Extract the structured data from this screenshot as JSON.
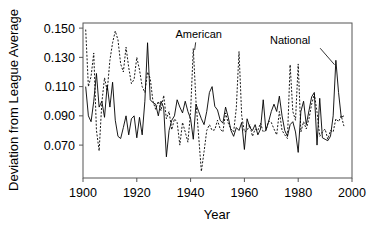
{
  "chart_data": {
    "type": "line",
    "title": "",
    "xlabel": "Year",
    "ylabel": "Deviation from League Average",
    "xlim": [
      1900,
      2000
    ],
    "ylim": [
      0.0475,
      0.1535
    ],
    "xticks": [
      1900,
      1920,
      1940,
      1960,
      1980,
      2000
    ],
    "xtick_labels": [
      "1900",
      "1920",
      "1940",
      "1960",
      "1980",
      "2000"
    ],
    "yticks": [
      0.07,
      0.09,
      0.11,
      0.13,
      0.15
    ],
    "ytick_labels": [
      "0.070",
      "0.090",
      "0.110",
      "0.130",
      "0.150"
    ],
    "grid": false,
    "legend_position": "inline-annotations",
    "frame_color": "#555555",
    "series": [
      {
        "name": "American",
        "style": "dashed",
        "color": "#000000",
        "annotation": {
          "label": "American",
          "text_x": 1943,
          "text_y": 0.143,
          "point_x": 1941.5,
          "point_y": 0.135
        },
        "x": [
          1901,
          1902,
          1903,
          1904,
          1905,
          1906,
          1907,
          1908,
          1909,
          1910,
          1911,
          1912,
          1913,
          1914,
          1915,
          1916,
          1917,
          1918,
          1919,
          1920,
          1921,
          1922,
          1923,
          1924,
          1925,
          1926,
          1927,
          1928,
          1929,
          1930,
          1931,
          1932,
          1933,
          1934,
          1935,
          1936,
          1937,
          1938,
          1939,
          1940,
          1941,
          1942,
          1943,
          1944,
          1945,
          1946,
          1947,
          1948,
          1949,
          1950,
          1951,
          1952,
          1953,
          1954,
          1955,
          1956,
          1957,
          1958,
          1959,
          1960,
          1961,
          1962,
          1963,
          1964,
          1965,
          1966,
          1967,
          1968,
          1969,
          1970,
          1971,
          1972,
          1973,
          1974,
          1975,
          1976,
          1977,
          1978,
          1979,
          1980,
          1981,
          1982,
          1983,
          1984,
          1985,
          1986,
          1987,
          1988,
          1989,
          1990,
          1991,
          1992,
          1993,
          1994,
          1995,
          1996,
          1997
        ],
        "values": [
          0.149,
          0.11,
          0.117,
          0.133,
          0.08,
          0.066,
          0.099,
          0.116,
          0.107,
          0.128,
          0.14,
          0.148,
          0.142,
          0.1255,
          0.12,
          0.137,
          0.123,
          0.112,
          0.115,
          0.13,
          0.1215,
          0.11,
          0.106,
          0.12,
          0.1155,
          0.1,
          0.0945,
          0.1,
          0.0935,
          0.104,
          0.088,
          0.093,
          0.0805,
          0.088,
          0.0855,
          0.07,
          0.0855,
          0.079,
          0.072,
          0.093,
          0.136,
          0.1,
          0.076,
          0.052,
          0.0655,
          0.08,
          0.084,
          0.08,
          0.0805,
          0.087,
          0.081,
          0.079,
          0.092,
          0.085,
          0.081,
          0.079,
          0.0955,
          0.134,
          0.09,
          0.079,
          0.08,
          0.084,
          0.076,
          0.081,
          0.08,
          0.085,
          0.079,
          0.08,
          0.0865,
          0.0855,
          0.081,
          0.077,
          0.093,
          0.08,
          0.077,
          0.0745,
          0.125,
          0.093,
          0.087,
          0.1255,
          0.079,
          0.086,
          0.081,
          0.088,
          0.098,
          0.105,
          0.0925,
          0.076,
          0.079,
          0.081,
          0.074,
          0.08,
          0.079,
          0.088,
          0.086,
          0.09,
          0.083
        ]
      },
      {
        "name": "National",
        "style": "solid",
        "color": "#000000",
        "annotation": {
          "label": "National",
          "text_x": 1977,
          "text_y": 0.139,
          "point_x": 1993.5,
          "point_y": 0.125
        },
        "x": [
          1901,
          1902,
          1903,
          1904,
          1905,
          1906,
          1907,
          1908,
          1909,
          1910,
          1911,
          1912,
          1913,
          1914,
          1915,
          1916,
          1917,
          1918,
          1919,
          1920,
          1921,
          1922,
          1923,
          1924,
          1925,
          1926,
          1927,
          1928,
          1929,
          1930,
          1931,
          1932,
          1933,
          1934,
          1935,
          1936,
          1937,
          1938,
          1939,
          1940,
          1941,
          1942,
          1943,
          1944,
          1945,
          1946,
          1947,
          1948,
          1949,
          1950,
          1951,
          1952,
          1953,
          1954,
          1955,
          1956,
          1957,
          1958,
          1959,
          1960,
          1961,
          1962,
          1963,
          1964,
          1965,
          1966,
          1967,
          1968,
          1969,
          1970,
          1971,
          1972,
          1973,
          1974,
          1975,
          1976,
          1977,
          1978,
          1979,
          1980,
          1981,
          1982,
          1983,
          1984,
          1985,
          1986,
          1987,
          1988,
          1989,
          1990,
          1991,
          1992,
          1993,
          1994,
          1995,
          1996,
          1997
        ],
        "values": [
          0.11,
          0.09,
          0.086,
          0.1,
          0.119,
          0.096,
          0.1,
          0.089,
          0.111,
          0.096,
          0.113,
          0.087,
          0.076,
          0.0745,
          0.082,
          0.09,
          0.077,
          0.088,
          0.09,
          0.075,
          0.089,
          0.077,
          0.1,
          0.14,
          0.101,
          0.099,
          0.098,
          0.09,
          0.1,
          0.0955,
          0.062,
          0.08,
          0.087,
          0.09,
          0.101,
          0.096,
          0.092,
          0.1,
          0.093,
          0.088,
          0.074,
          0.098,
          0.093,
          0.088,
          0.084,
          0.093,
          0.106,
          0.11,
          0.0965,
          0.094,
          0.087,
          0.085,
          0.096,
          0.089,
          0.08,
          0.076,
          0.082,
          0.08,
          0.0855,
          0.067,
          0.088,
          0.082,
          0.08,
          0.084,
          0.077,
          0.081,
          0.101,
          0.08,
          0.086,
          0.093,
          0.098,
          0.093,
          0.1035,
          0.09,
          0.08,
          0.076,
          0.084,
          0.086,
          0.079,
          0.065,
          0.093,
          0.1,
          0.084,
          0.0935,
          0.103,
          0.106,
          0.07,
          0.102,
          0.075,
          0.074,
          0.073,
          0.076,
          0.09,
          0.128,
          0.106,
          0.089,
          0.09
        ]
      }
    ]
  }
}
